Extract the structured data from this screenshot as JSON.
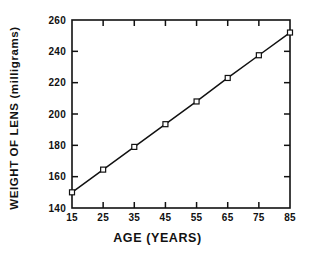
{
  "chart_data": {
    "type": "line",
    "title": "",
    "subtitle": "",
    "xlabel": "AGE (YEARS)",
    "ylabel": "WEIGHT OF LENS (milligrams)",
    "x": [
      15,
      25,
      35,
      45,
      55,
      65,
      75,
      85
    ],
    "values": [
      150,
      164.5,
      179,
      193.5,
      208,
      223,
      237.5,
      252
    ],
    "series": [
      {
        "name": "Lens weight",
        "x": [
          15,
          25,
          35,
          45,
          55,
          65,
          75,
          85
        ],
        "values": [
          150,
          164.5,
          179,
          193.5,
          208,
          223,
          237.5,
          252
        ]
      }
    ],
    "xlim": [
      15,
      85
    ],
    "ylim": [
      140,
      260
    ],
    "xticks": [
      15,
      25,
      35,
      45,
      55,
      65,
      75,
      85
    ],
    "yticks": [
      140,
      160,
      180,
      200,
      220,
      240,
      260
    ],
    "xtick_labels": [
      "15",
      "25",
      "35",
      "45",
      "55",
      "65",
      "75",
      "85"
    ],
    "ytick_labels": [
      "140",
      "160",
      "180",
      "200",
      "220",
      "240",
      "260"
    ],
    "grid": false,
    "legend": null,
    "legend_position": "none",
    "marker": "open-square",
    "line_color": "#111111",
    "marker_face_color": "#ffffff",
    "marker_edge_color": "#111111",
    "background_color": "#ffffff",
    "annotations": []
  }
}
